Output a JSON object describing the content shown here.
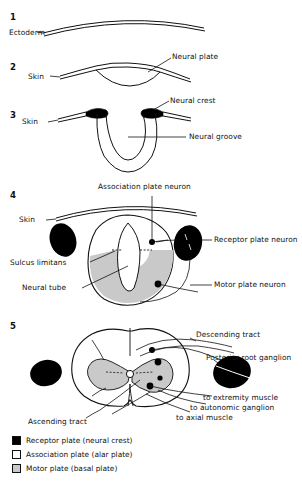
{
  "figure": {
    "title_present": false,
    "stages": [
      {
        "number": "1",
        "labels": [
          {
            "name": "ectoderm-label",
            "text": "Ectoderm"
          }
        ]
      },
      {
        "number": "2",
        "labels": [
          {
            "name": "skin-label",
            "text": "Skin"
          },
          {
            "name": "neural-plate-label",
            "text": "Neural plate"
          }
        ]
      },
      {
        "number": "3",
        "labels": [
          {
            "name": "skin-label",
            "text": "Skin"
          },
          {
            "name": "neural-crest-label",
            "text": "Neural crest"
          },
          {
            "name": "neural-groove-label",
            "text": "Neural groove"
          }
        ]
      },
      {
        "number": "4",
        "labels": [
          {
            "name": "skin-label",
            "text": "Skin"
          },
          {
            "name": "association-plate-neuron-label",
            "text": "Association plate neuron"
          },
          {
            "name": "receptor-plate-neuron-label",
            "text": "Receptor plate neuron"
          },
          {
            "name": "sulcus-limitans-label",
            "text": "Sulcus limitans"
          },
          {
            "name": "neural-tube-label",
            "text": "Neural tube"
          },
          {
            "name": "motor-plate-neuron-label",
            "text": "Motor plate neuron"
          }
        ]
      },
      {
        "number": "5",
        "labels": [
          {
            "name": "descending-tract-label",
            "text": "Descending tract"
          },
          {
            "name": "posterior-root-ganglion-label",
            "text": "Posterior root ganglion"
          },
          {
            "name": "to-extremity-muscle-label",
            "text": "to extremity muscle"
          },
          {
            "name": "to-autonomic-ganglion-label",
            "text": "to autonomic ganglion"
          },
          {
            "name": "to-axial-muscle-label",
            "text": "to axial muscle"
          },
          {
            "name": "ascending-tract-label",
            "text": "Ascending tract"
          }
        ]
      }
    ],
    "stage_numbers": {
      "s1": "1",
      "s2": "2",
      "s3": "3",
      "s4": "4",
      "s5": "5"
    },
    "labels": {
      "ectoderm": "Ectoderm",
      "skin2": "Skin",
      "neural_plate": "Neural plate",
      "skin3": "Skin",
      "neural_crest": "Neural crest",
      "neural_groove": "Neural groove",
      "skin4": "Skin",
      "association_plate_neuron": "Association plate neuron",
      "receptor_plate_neuron": "Receptor plate neuron",
      "sulcus_limitans": "Sulcus limitans",
      "neural_tube": "Neural tube",
      "motor_plate_neuron": "Motor plate neuron",
      "descending_tract": "Descending tract",
      "posterior_root_ganglion": "Posterior root ganglion",
      "to_extremity_muscle": "to extremity muscle",
      "to_autonomic_ganglion": "to autonomic ganglion",
      "to_axial_muscle": "to axial muscle",
      "ascending_tract": "Ascending tract"
    },
    "legend": [
      {
        "swatch": "black",
        "text": "Receptor  plate (neural crest)",
        "color": "#000000"
      },
      {
        "swatch": "white",
        "text": "Association plate (alar plate)",
        "color": "#ffffff"
      },
      {
        "swatch": "gray",
        "text": "Motor plate (basal plate)",
        "color": "#c9c9c9"
      }
    ],
    "colors": {
      "ink": "#111111",
      "neural_crest_fill": "#000000",
      "alar_fill": "#ffffff",
      "basal_fill": "#c9c9c9",
      "background": "#ffffff"
    }
  }
}
